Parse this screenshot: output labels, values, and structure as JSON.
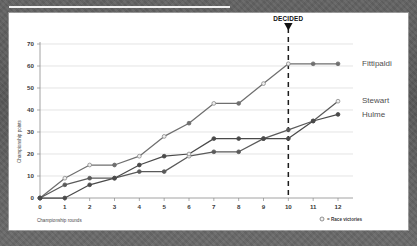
{
  "figure": {
    "annotation": {
      "line1": "TITLE",
      "line2": "DECIDED",
      "marker": "down-triangle"
    },
    "legend_note": {
      "symbol": "○",
      "text": "= Race victories"
    }
  },
  "chart_data": {
    "type": "line",
    "title": "",
    "xlabel": "Championship rounds",
    "ylabel": "Championship points",
    "x": [
      0,
      1,
      2,
      3,
      4,
      5,
      6,
      7,
      8,
      9,
      10,
      11,
      12
    ],
    "xlim": [
      0,
      12
    ],
    "ylim": [
      0,
      70
    ],
    "yticks": [
      0,
      10,
      20,
      30,
      40,
      50,
      60,
      70
    ],
    "xticks": [
      "0",
      "1",
      "2",
      "3",
      "4",
      "5",
      "6",
      "7",
      "8",
      "9",
      "10",
      "11",
      "12"
    ],
    "grid": true,
    "legend_position": "right-of-axes",
    "annotations": [
      {
        "text": "TITLE DECIDED",
        "x": 10,
        "type": "vertical-dashed-line"
      }
    ],
    "marker_semantics": {
      "open_circle": "Race victories",
      "filled_circle": "No race victory"
    },
    "series": [
      {
        "name": "Fittipaldi",
        "color": "#6f6f6f",
        "values": [
          0,
          9,
          15,
          15,
          19,
          28,
          34,
          43,
          43,
          52,
          61,
          61,
          61
        ],
        "victories": [
          false,
          true,
          true,
          false,
          true,
          true,
          false,
          true,
          false,
          true,
          true,
          false,
          false
        ]
      },
      {
        "name": "Stewart",
        "color": "#5a5a5a",
        "values": [
          0,
          6,
          9,
          9,
          12,
          12,
          19,
          21,
          21,
          27,
          31,
          35,
          44
        ],
        "victories": [
          false,
          false,
          false,
          false,
          false,
          false,
          true,
          false,
          false,
          false,
          false,
          false,
          true
        ]
      },
      {
        "name": "Hulme",
        "color": "#4a4a4a",
        "values": [
          0,
          0,
          6,
          9,
          15,
          19,
          20,
          27,
          27,
          27,
          27,
          35,
          38
        ],
        "victories": [
          false,
          false,
          false,
          false,
          false,
          false,
          true,
          false,
          false,
          false,
          false,
          false,
          false
        ]
      }
    ]
  }
}
